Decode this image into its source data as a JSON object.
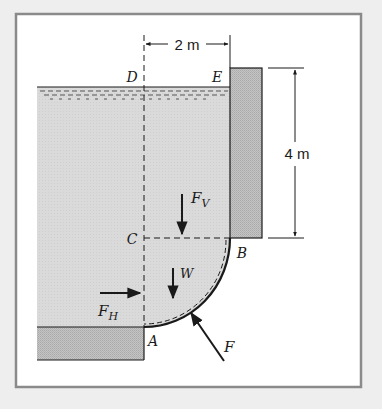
{
  "figure": {
    "type": "fluid-statics-free-body-diagram",
    "colors": {
      "background": "#eeeeee",
      "panel": "#ffffff",
      "frame": "#8a8a8a",
      "water": "#d9d9d9",
      "solid": "#bdbdbd",
      "line": "#1a1a1a"
    },
    "points": {
      "A": "A",
      "B": "B",
      "C": "C",
      "D": "D",
      "E": "E"
    },
    "forces": {
      "vertical": {
        "symbol": "F",
        "subscript": "V"
      },
      "horizontal": {
        "symbol": "F",
        "subscript": "H"
      },
      "weight": {
        "symbol": "W"
      },
      "resultant": {
        "symbol": "F"
      }
    },
    "dimensions": {
      "width": "2 m",
      "height": "4 m"
    }
  }
}
